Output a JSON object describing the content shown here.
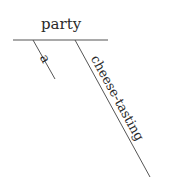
{
  "diagram": {
    "type": "sentence-diagram",
    "subject": "party",
    "modifiers": [
      {
        "label": "a"
      },
      {
        "label": "cheese-tasting"
      }
    ],
    "line_color": "#555555",
    "text_color": "#2a2a2a"
  }
}
